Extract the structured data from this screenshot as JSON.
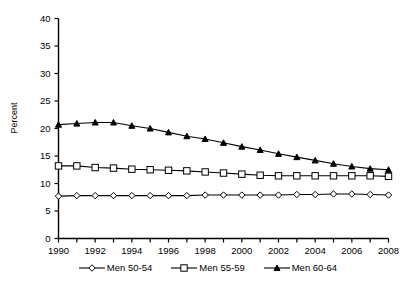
{
  "chart_data": {
    "type": "line",
    "title": "",
    "subtitle": "",
    "xlabel": "",
    "ylabel": "Percent",
    "xlim": [
      1990,
      2008
    ],
    "ylim": [
      0,
      40
    ],
    "ytick_step": 5,
    "xtick_label_step": 2,
    "grid": false,
    "legend_position": "bottom",
    "x": [
      1990,
      1991,
      1992,
      1993,
      1994,
      1995,
      1996,
      1997,
      1998,
      1999,
      2000,
      2001,
      2002,
      2003,
      2004,
      2005,
      2006,
      2007,
      2008
    ],
    "xtick_labels": [
      "1990",
      "1992",
      "1994",
      "1996",
      "1998",
      "2000",
      "2002",
      "2004",
      "2006",
      "2008"
    ],
    "ytick_labels": [
      "0",
      "5",
      "10",
      "15",
      "20",
      "25",
      "30",
      "35",
      "40"
    ],
    "series": [
      {
        "name": "Men 50-54",
        "marker": "open-diamond",
        "values": [
          7.7,
          7.8,
          7.8,
          7.8,
          7.8,
          7.8,
          7.8,
          7.8,
          7.9,
          7.9,
          7.9,
          7.9,
          7.9,
          8.0,
          8.0,
          8.1,
          8.1,
          8.0,
          7.9
        ]
      },
      {
        "name": "Men 55-59",
        "marker": "open-square",
        "values": [
          13.2,
          13.2,
          12.9,
          12.8,
          12.6,
          12.5,
          12.4,
          12.3,
          12.1,
          11.9,
          11.7,
          11.5,
          11.4,
          11.4,
          11.4,
          11.4,
          11.4,
          11.4,
          11.3
        ]
      },
      {
        "name": "Men 60-64",
        "marker": "filled-triangle",
        "values": [
          20.7,
          20.9,
          21.1,
          21.1,
          20.5,
          20.0,
          19.3,
          18.6,
          18.1,
          17.4,
          16.7,
          16.1,
          15.4,
          14.8,
          14.2,
          13.6,
          13.1,
          12.7,
          12.5
        ]
      }
    ]
  },
  "legend": {
    "items": [
      {
        "label": "Men 50-54",
        "marker": "open-diamond"
      },
      {
        "label": "Men 55-59",
        "marker": "open-square"
      },
      {
        "label": "Men 60-64",
        "marker": "filled-triangle"
      }
    ]
  },
  "colors": {
    "line": "#000000",
    "marker_fill_open": "#ffffff",
    "marker_fill_solid": "#000000",
    "axis": "#000000",
    "background": "#ffffff"
  }
}
